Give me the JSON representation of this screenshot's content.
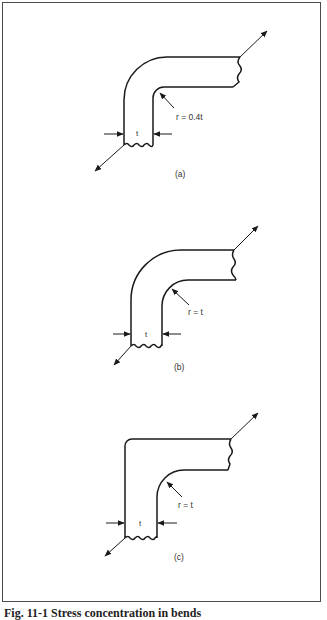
{
  "figure": {
    "caption": "Fig. 11-1 Stress concentration in bends",
    "panels": [
      {
        "id": "a",
        "label": "(a)",
        "radius_label": "r = 0.4t",
        "thickness_label": "t"
      },
      {
        "id": "b",
        "label": "(b)",
        "radius_label": "r = t",
        "thickness_label": "t"
      },
      {
        "id": "c",
        "label": "(c)",
        "radius_label": "r = t",
        "thickness_label": "t"
      }
    ]
  },
  "colors": {
    "line": "#1a1a1a",
    "frame": "#4a4a4a",
    "background": "#ffffff"
  }
}
